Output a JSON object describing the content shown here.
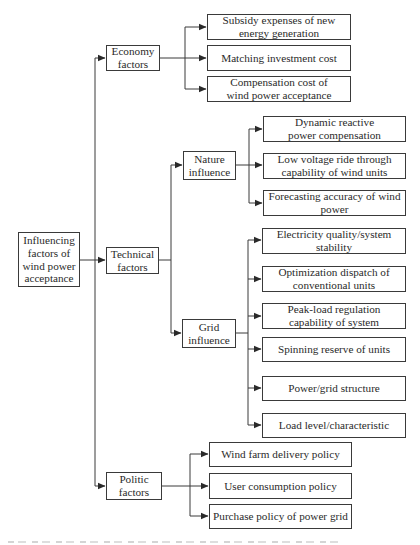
{
  "diagram": {
    "type": "hierarchy-tree",
    "root": {
      "label": "Influencing factors of wind power acceptance"
    },
    "branches": {
      "economy": {
        "label": "Economy factors",
        "children": [
          "Subsidy expenses of new energy generation",
          "Matching investment cost",
          "Compensation cost of wind power acceptance"
        ]
      },
      "technical": {
        "label": "Technical factors",
        "sub": {
          "nature": {
            "label": "Nature influence",
            "children": [
              "Dynamic reactive power compensation",
              "Low voltage ride through capability of wind units",
              "Forecasting accuracy of wind power"
            ]
          },
          "grid": {
            "label": "Grid influence",
            "children": [
              "Electricity quality/system stability",
              "Optimization dispatch of conventional units",
              "Peak-load regulation capability of system",
              "Spinning reserve of units",
              "Power/grid structure",
              "Load level/characteristic"
            ]
          }
        }
      },
      "politic": {
        "label": "Politic factors",
        "children": [
          "Wind farm delivery policy",
          "User consumption policy",
          "Purchase policy of power grid"
        ]
      }
    },
    "colors": {
      "line": "#3a3a3a",
      "box_border": "#3a3a3a",
      "text": "#2a2a2a",
      "background": "#ffffff"
    }
  }
}
